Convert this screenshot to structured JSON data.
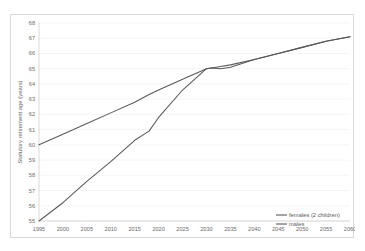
{
  "figure": {
    "title": "",
    "border_color": "#d9d9d9",
    "background": "#ffffff"
  },
  "chart_data": {
    "type": "line",
    "title": "",
    "subtitle": "",
    "xlabel": "",
    "ylabel": "Statutory retirement age (years)",
    "xlim": [
      1995,
      2060
    ],
    "ylim": [
      55,
      68
    ],
    "grid": true,
    "legend_position": "inside-right-bottom",
    "x_ticks": [
      1995,
      2000,
      2005,
      2010,
      2015,
      2020,
      2025,
      2030,
      2035,
      2040,
      2045,
      2050,
      2055,
      2060
    ],
    "y_ticks": [
      55,
      56,
      57,
      58,
      59,
      60,
      61,
      62,
      63,
      64,
      65,
      66,
      67,
      68
    ],
    "x": [
      1995,
      2000,
      2005,
      2010,
      2015,
      2018,
      2020,
      2025,
      2030,
      2031,
      2033,
      2035,
      2040,
      2045,
      2050,
      2055,
      2060
    ],
    "series": [
      {
        "name": "females (2 children)",
        "color": "#595959",
        "values": [
          55.0,
          56.2,
          57.6,
          58.9,
          60.3,
          60.9,
          61.8,
          63.6,
          65.0,
          65.05,
          65.0,
          65.1,
          65.6,
          66.0,
          66.4,
          66.8,
          67.1
        ]
      },
      {
        "name": "males",
        "color": "#595959",
        "values": [
          60.0,
          60.7,
          61.4,
          62.1,
          62.8,
          63.3,
          63.6,
          64.3,
          65.0,
          65.05,
          65.15,
          65.25,
          65.6,
          66.0,
          66.4,
          66.8,
          67.1
        ]
      }
    ]
  },
  "legend": {
    "items": [
      {
        "label": "females (2 children)",
        "color": "#595959"
      },
      {
        "label": "males",
        "color": "#595959"
      }
    ]
  }
}
